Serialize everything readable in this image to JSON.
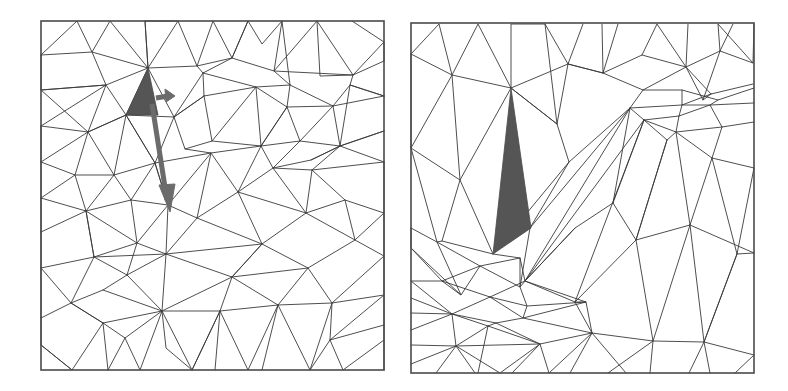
{
  "figure": {
    "panels": [
      {
        "id": "left",
        "description": "Regular triangular mesh with a highlighted dark triangle element and two displacement arrows",
        "highlight_color": "#555555",
        "arrow_color": "#6b6b6b",
        "line_color": "#3a3a3a"
      },
      {
        "id": "right",
        "description": "Deformed triangular mesh after node displacement; highlighted element is elongated into a thin sliver",
        "highlight_color": "#555555",
        "line_color": "#3a3a3a"
      }
    ]
  }
}
